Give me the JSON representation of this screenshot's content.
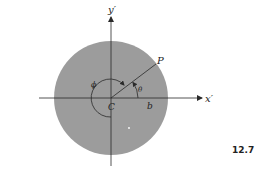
{
  "figure": {
    "number": "12.7",
    "labels": {
      "x_axis": "x′",
      "y_axis": "y′",
      "center": "C",
      "point": "P",
      "radius_mark": "b",
      "angle_theta": "θ",
      "angle_phi": "ϕ"
    },
    "colors": {
      "disk_fill": "#9c9c9c",
      "lines": "#2a2a2a",
      "background": "#ffffff"
    },
    "geometry": {
      "center": [
        111,
        98
      ],
      "disk_radius": 57,
      "point_P": [
        155,
        64
      ]
    }
  }
}
